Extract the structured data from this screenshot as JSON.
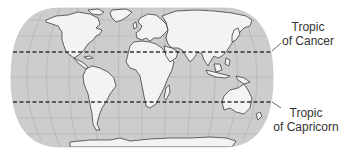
{
  "map": {
    "projection": "robinson-like world map",
    "colors": {
      "ocean": "#cdcdcd",
      "land": "#f3f3f3",
      "coastline": "#2a2a2a",
      "graticule": "#a9a9a9",
      "tropic_line": "#333333"
    },
    "lines": [
      {
        "name": "Tropic of Cancer",
        "style": "dashed"
      },
      {
        "name": "Tropic of Capricorn",
        "style": "dashed"
      }
    ]
  },
  "labels": {
    "cancer": {
      "line1": "Tropic",
      "line2": "of Cancer"
    },
    "capricorn": {
      "line1": "Tropic",
      "line2": "of Capricorn"
    }
  }
}
